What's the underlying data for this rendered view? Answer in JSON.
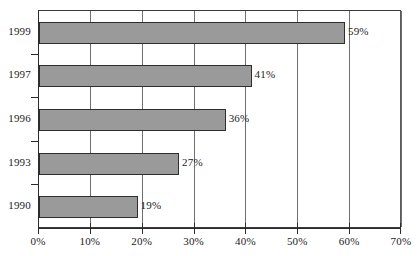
{
  "chart_data": {
    "type": "bar",
    "orientation": "horizontal",
    "title": "",
    "subtitle": "",
    "xlabel": "",
    "ylabel": "",
    "categories": [
      "1999",
      "1997",
      "1996",
      "1993",
      "1990"
    ],
    "values": [
      59,
      41,
      36,
      27,
      19
    ],
    "value_labels": [
      "59%",
      "41%",
      "36%",
      "27%",
      "19%"
    ],
    "xlim": [
      0,
      70
    ],
    "xticks": [
      0,
      10,
      20,
      30,
      40,
      50,
      60,
      70
    ],
    "xtick_labels": [
      "0%",
      "10%",
      "20%",
      "30%",
      "40%",
      "50%",
      "60%",
      "70%"
    ],
    "grid": "vertical",
    "legend": "none",
    "series": [
      {
        "name": "",
        "values": [
          59,
          41,
          36,
          27,
          19
        ]
      }
    ],
    "colors": {
      "bar_fill": "#9a9a9a",
      "bar_border": "#2e2e2e",
      "gridline": "#707070",
      "axis": "#2c2c2c",
      "text": "#1b1b1b",
      "background": "#ffffff"
    }
  }
}
